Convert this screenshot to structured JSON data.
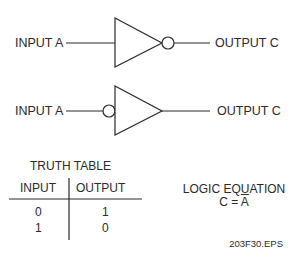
{
  "gates": [
    {
      "type": "inverter-output-bubble",
      "input_label": "INPUT A",
      "output_label": "OUTPUT C"
    },
    {
      "type": "inverter-input-bubble",
      "input_label": "INPUT A",
      "output_label": "OUTPUT C"
    }
  ],
  "truth_table": {
    "title": "TRUTH TABLE",
    "headers": [
      "INPUT",
      "OUTPUT"
    ],
    "rows": [
      [
        "0",
        "1"
      ],
      [
        "1",
        "0"
      ]
    ]
  },
  "equation": {
    "title": "LOGIC EQUATION",
    "lhs": "C = ",
    "rhs": "A"
  },
  "figure_id": "203F30.EPS"
}
